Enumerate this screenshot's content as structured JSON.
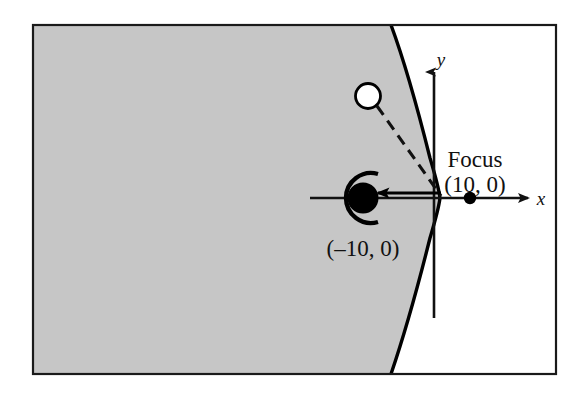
{
  "figure": {
    "kind": "hyperbola-reflection-diagram",
    "frame": {
      "border_color": "#1a1a1a",
      "shaded_region_color": "#c6c6c6",
      "unshaded_region_color": "#ffffff"
    },
    "axes": {
      "x_axis_label": "x",
      "y_axis_label": "y",
      "axis_color": "#111111"
    },
    "curve": {
      "name": "hyperbola-right-branch",
      "stroke_color": "#000000"
    },
    "points": [
      {
        "id": "vertex-focus-left",
        "style": "filled-circle-with-reflector-arc",
        "label": "(–10, 0)"
      },
      {
        "id": "focus-right",
        "style": "filled-dot",
        "label_line1": "Focus",
        "label_line2": "(10, 0)"
      },
      {
        "id": "incoming-particle",
        "style": "open-circle",
        "label": ""
      }
    ],
    "paths": [
      {
        "id": "incoming-dashed-ray",
        "style": "dashed"
      },
      {
        "id": "reflected-ray-arrow",
        "style": "solid-arrow"
      }
    ]
  }
}
